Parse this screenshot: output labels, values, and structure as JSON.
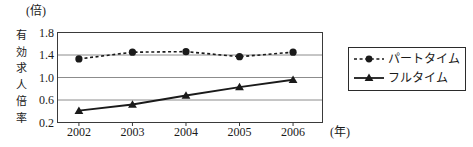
{
  "chart_data": {
    "type": "line",
    "title": "",
    "subtitle": "",
    "xlabel": "(年)",
    "ylabel": "有効求人倍率",
    "unit_caption": "(倍)",
    "categories": [
      "2002",
      "2003",
      "2004",
      "2005",
      "2006"
    ],
    "x": [
      2002,
      2003,
      2004,
      2005,
      2006
    ],
    "xlim": [
      2001.6,
      2006.55
    ],
    "ylim": [
      0.2,
      1.8
    ],
    "yticks": [
      "1.8",
      "1.4",
      "1.0",
      "0.6",
      "0.2"
    ],
    "ytick_values": [
      1.8,
      1.4,
      1.0,
      0.6,
      0.2
    ],
    "grid": "horizontal",
    "legend_position": "right",
    "series": [
      {
        "name": "パートタイム",
        "values": [
          1.33,
          1.45,
          1.46,
          1.37,
          1.45
        ],
        "line_style": "dashed",
        "marker": "circle",
        "color": "#1a1a1a"
      },
      {
        "name": "フルタイム",
        "values": [
          0.41,
          0.52,
          0.68,
          0.83,
          0.96
        ],
        "line_style": "solid",
        "marker": "triangle",
        "color": "#1a1a1a"
      }
    ]
  },
  "axes": {
    "unit_caption": "(倍)",
    "y_title": "有効求人倍率",
    "x_title": "(年)"
  },
  "legend": {
    "items": [
      {
        "label": "パートタイム"
      },
      {
        "label": "フルタイム"
      }
    ]
  },
  "colors": {
    "ink": "#1a1a1a",
    "frame": "#3a3a3a",
    "gridline": "#8c8c8c",
    "background": "#ffffff"
  }
}
